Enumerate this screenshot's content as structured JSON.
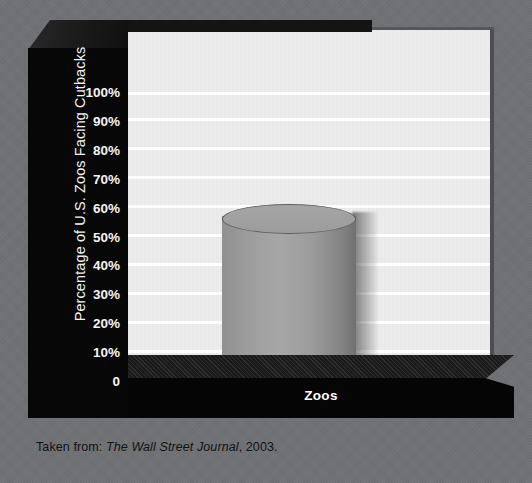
{
  "chart_data": {
    "type": "bar",
    "title": "",
    "xlabel": "Zoos",
    "ylabel": "Percentage of U.S. Zoos Facing Cutbacks",
    "categories": [
      "Zoos"
    ],
    "values": [
      60
    ],
    "ylim": [
      0,
      100
    ],
    "ytick_labels": [
      "100%",
      "90%",
      "80%",
      "70%",
      "60%",
      "50%",
      "40%",
      "30%",
      "20%",
      "10%",
      "0"
    ],
    "ytick_values": [
      100,
      90,
      80,
      70,
      60,
      50,
      40,
      30,
      20,
      10,
      0
    ],
    "grid": true,
    "legend": "none",
    "bar_style": "3d-cylinder",
    "annotations": []
  },
  "axis": {
    "y_title": "Percentage of U.S. Zoos Facing Cutbacks",
    "x_label": "Zoos"
  },
  "caption": {
    "prefix": "Taken from:",
    "source": "The Wall Street Journal",
    "suffix": ", 2003."
  },
  "colors": {
    "background": "#6f7073",
    "plot_wall": "#ececec",
    "gridline": "#ffffff",
    "axis_block": "#070707",
    "bar_fill": "#9b9c9b",
    "bar_edge": "#5e5f5e",
    "tick_text": "#f4f4f4",
    "caption_text": "#111213"
  }
}
